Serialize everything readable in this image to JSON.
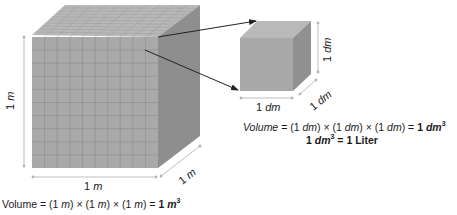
{
  "big_cube": {
    "height_label_num": "1",
    "height_label_unit": "m",
    "width_label_num": "1",
    "width_label_unit": "m",
    "depth_label_num": "1",
    "depth_label_unit": "m",
    "grid_divisions": 10,
    "colors": {
      "front": "#a9a9a9",
      "top": "#b8b8b8",
      "side": "#8e8e8e",
      "grid": "#8a8a8a"
    }
  },
  "small_cube": {
    "height_label_num": "1",
    "height_label_unit": "dm",
    "width_label_num": "1",
    "width_label_unit": "dm",
    "depth_label_num": "1",
    "depth_label_unit": "dm",
    "colors": {
      "front": "#a8a8a8",
      "top": "#b9b9b9",
      "side": "#909090"
    }
  },
  "equations": {
    "big": {
      "prefix": "Volume = (1 ",
      "u1": "m",
      "mid1": ") × (1 ",
      "u2": "m",
      "mid2": ") × (1 ",
      "u3": "m",
      "mid3": ") = ",
      "result_num": "1 ",
      "result_unit": "m",
      "result_exp": "3"
    },
    "small": {
      "prefix_italic": "Volume",
      "eq1": " = (1 ",
      "u1": "dm",
      "mid1": ") × (1 ",
      "u2": "dm",
      "mid2": ") × (1 ",
      "u3": "dm",
      "mid3": ") = ",
      "result_num": "1 ",
      "result_unit": "dm",
      "result_exp": "3"
    },
    "liter": {
      "num": "1 ",
      "unit": "dm",
      "exp": "3",
      "rest": " = 1 Liter"
    }
  },
  "colors": {
    "arrow": "#222222",
    "dimension_line": "#b5b5b5",
    "text": "#1a1a1a"
  }
}
